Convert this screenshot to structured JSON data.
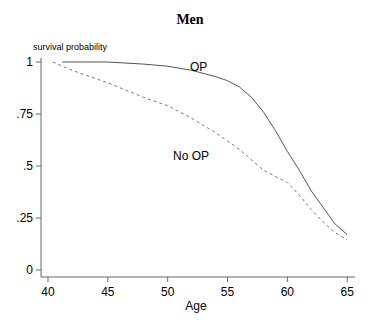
{
  "chart_data": {
    "type": "line",
    "title": "Men",
    "xlabel": "Age",
    "ylabel": "survival probability",
    "xlim": [
      40,
      65
    ],
    "ylim": [
      0,
      1
    ],
    "xticks": [
      40,
      45,
      50,
      55,
      60,
      65
    ],
    "yticks": [
      0,
      0.25,
      0.5,
      0.75,
      1
    ],
    "xtick_labels": [
      "40",
      "45",
      "50",
      "55",
      "60",
      "65"
    ],
    "ytick_labels": [
      "0",
      ".25",
      ".5",
      ".75",
      "1"
    ],
    "grid": false,
    "legend": "none (inline labels)",
    "annotations": [
      {
        "text": "OP",
        "x": 55.2,
        "y": 0.96
      },
      {
        "text": "No OP",
        "x": 51.5,
        "y": 0.57
      }
    ],
    "series": [
      {
        "name": "OP",
        "style": "solid",
        "x": [
          41.2,
          45,
          48,
          50,
          52,
          54,
          55,
          56,
          57,
          58,
          59,
          60,
          61,
          62,
          63,
          64,
          65
        ],
        "y": [
          1.0,
          1.0,
          0.99,
          0.98,
          0.96,
          0.93,
          0.91,
          0.88,
          0.83,
          0.76,
          0.67,
          0.57,
          0.48,
          0.38,
          0.3,
          0.22,
          0.17
        ]
      },
      {
        "name": "No OP",
        "style": "dashed",
        "x": [
          40.4,
          42,
          45,
          48,
          50,
          52,
          54,
          55,
          56,
          58,
          60,
          61,
          62,
          63,
          64,
          65
        ],
        "y": [
          1.0,
          0.96,
          0.9,
          0.83,
          0.79,
          0.73,
          0.66,
          0.62,
          0.58,
          0.48,
          0.42,
          0.36,
          0.29,
          0.23,
          0.18,
          0.145
        ]
      }
    ]
  }
}
